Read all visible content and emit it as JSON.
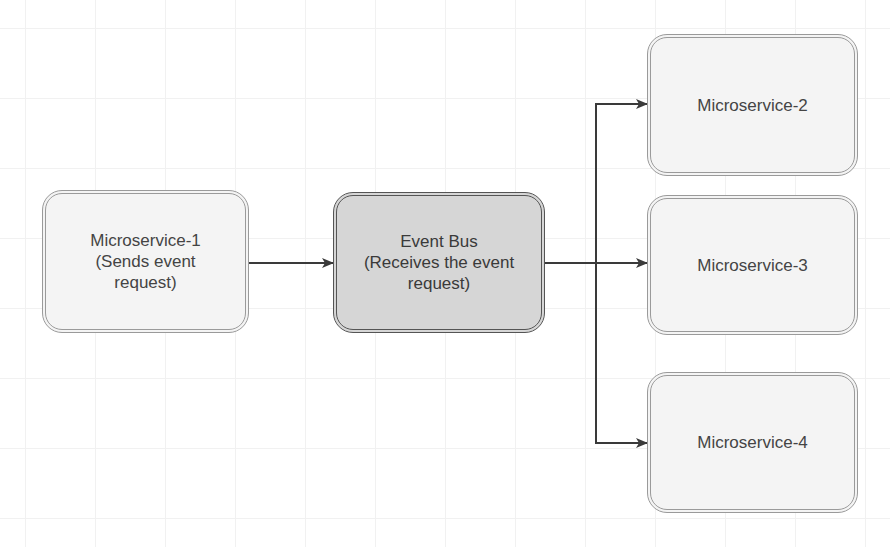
{
  "diagram": {
    "type": "flowchart",
    "nodes": [
      {
        "id": "ms1",
        "label": "Microservice-1\n(Sends event\nrequest)"
      },
      {
        "id": "bus",
        "label": "Event Bus\n(Receives the event\nrequest)"
      },
      {
        "id": "ms2",
        "label": "Microservice-2"
      },
      {
        "id": "ms3",
        "label": "Microservice-3"
      },
      {
        "id": "ms4",
        "label": "Microservice-4"
      }
    ],
    "edges": [
      {
        "from": "ms1",
        "to": "bus"
      },
      {
        "from": "bus",
        "to": "ms2"
      },
      {
        "from": "bus",
        "to": "ms3"
      },
      {
        "from": "bus",
        "to": "ms4"
      }
    ]
  },
  "colors": {
    "node_fill": "#f4f4f4",
    "node_border": "#9a9a9a",
    "bus_fill": "#d6d6d6",
    "bus_border": "#555555",
    "edge": "#3a3a3a",
    "grid": "#f1f1f1"
  }
}
